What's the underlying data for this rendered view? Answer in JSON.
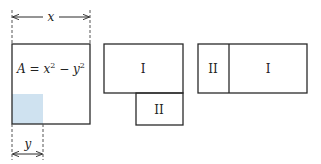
{
  "diagram": {
    "colors": {
      "stroke": "#2a2a2a",
      "shade": "#cfe2f0",
      "dash": "#555555"
    },
    "square": {
      "formula_prefix": "A = x",
      "formula_exp1": "2",
      "formula_mid": " − y",
      "formula_exp2": "2",
      "dimension_x": "x",
      "dimension_y": "y"
    },
    "figure2": {
      "region_top": "I",
      "region_bottom": "II"
    },
    "figure3": {
      "region_left": "II",
      "region_right": "I"
    }
  }
}
